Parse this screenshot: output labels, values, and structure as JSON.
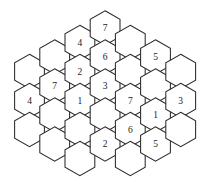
{
  "puzzle": {
    "title": "Hexagonal number grid",
    "grid_type": "pointy-top hexagon tiling",
    "geometry": {
      "hex_radius": 17.2,
      "column_step_x": 25.2,
      "row_step_y": 29.0,
      "column_offset_y": 14.5,
      "origin_x": 29.5,
      "origin_y": 100.5
    },
    "columns": [
      {
        "index": 0,
        "center_x": 29.5,
        "cells": [
          {
            "id": "c0r0",
            "cx": 29.5,
            "cy": 71.5,
            "label": ""
          },
          {
            "id": "c0r1",
            "cx": 29.5,
            "cy": 100.5,
            "label": "4"
          },
          {
            "id": "c0r2",
            "cx": 29.5,
            "cy": 129.5,
            "label": ""
          }
        ]
      },
      {
        "index": 1,
        "center_x": 54.7,
        "cells": [
          {
            "id": "c1r0",
            "cx": 54.7,
            "cy": 57.0,
            "label": ""
          },
          {
            "id": "c1r1",
            "cx": 54.7,
            "cy": 86.0,
            "label": "7"
          },
          {
            "id": "c1r2",
            "cx": 54.7,
            "cy": 115.0,
            "label": ""
          },
          {
            "id": "c1r3",
            "cx": 54.7,
            "cy": 144.0,
            "label": ""
          }
        ]
      },
      {
        "index": 2,
        "center_x": 79.9,
        "cells": [
          {
            "id": "c2r0",
            "cx": 79.9,
            "cy": 42.5,
            "label": "4"
          },
          {
            "id": "c2r1",
            "cx": 79.9,
            "cy": 71.5,
            "label": "2"
          },
          {
            "id": "c2r2",
            "cx": 79.9,
            "cy": 100.5,
            "label": "1"
          },
          {
            "id": "c2r3",
            "cx": 79.9,
            "cy": 129.5,
            "label": ""
          },
          {
            "id": "c2r4",
            "cx": 79.9,
            "cy": 158.5,
            "label": ""
          }
        ]
      },
      {
        "index": 3,
        "center_x": 105.1,
        "cells": [
          {
            "id": "c3r0",
            "cx": 105.1,
            "cy": 28.0,
            "label": "7"
          },
          {
            "id": "c3r1",
            "cx": 105.1,
            "cy": 57.0,
            "label": "6"
          },
          {
            "id": "c3r2",
            "cx": 105.1,
            "cy": 86.0,
            "label": "3"
          },
          {
            "id": "c3r3",
            "cx": 105.1,
            "cy": 115.0,
            "label": ""
          },
          {
            "id": "c3r4",
            "cx": 105.1,
            "cy": 144.0,
            "label": "2"
          }
        ]
      },
      {
        "index": 4,
        "center_x": 130.3,
        "cells": [
          {
            "id": "c4r0",
            "cx": 130.3,
            "cy": 42.5,
            "label": ""
          },
          {
            "id": "c4r1",
            "cx": 130.3,
            "cy": 71.5,
            "label": ""
          },
          {
            "id": "c4r2",
            "cx": 130.3,
            "cy": 100.5,
            "label": "7"
          },
          {
            "id": "c4r3",
            "cx": 130.3,
            "cy": 129.5,
            "label": "6"
          },
          {
            "id": "c4r4",
            "cx": 130.3,
            "cy": 158.5,
            "label": ""
          }
        ]
      },
      {
        "index": 5,
        "center_x": 155.5,
        "cells": [
          {
            "id": "c5r0",
            "cx": 155.5,
            "cy": 57.0,
            "label": "5"
          },
          {
            "id": "c5r1",
            "cx": 155.5,
            "cy": 86.0,
            "label": ""
          },
          {
            "id": "c5r2",
            "cx": 155.5,
            "cy": 115.0,
            "label": "1"
          },
          {
            "id": "c5r3",
            "cx": 155.5,
            "cy": 144.0,
            "label": "5"
          }
        ]
      },
      {
        "index": 6,
        "center_x": 180.7,
        "cells": [
          {
            "id": "c6r0",
            "cx": 180.7,
            "cy": 71.5,
            "label": ""
          },
          {
            "id": "c6r1",
            "cx": 180.7,
            "cy": 100.5,
            "label": "3"
          },
          {
            "id": "c6r2",
            "cx": 180.7,
            "cy": 129.5,
            "label": ""
          }
        ]
      }
    ],
    "filled_values": [
      "4",
      "7",
      "4",
      "2",
      "1",
      "7",
      "6",
      "3",
      "2",
      "7",
      "6",
      "5",
      "1",
      "5",
      "3"
    ],
    "colors": {
      "background": "#ffffff",
      "cell_fill": "#ffffff",
      "cell_stroke": "#2b2b2b",
      "label_color": "#1a1a1a"
    }
  }
}
